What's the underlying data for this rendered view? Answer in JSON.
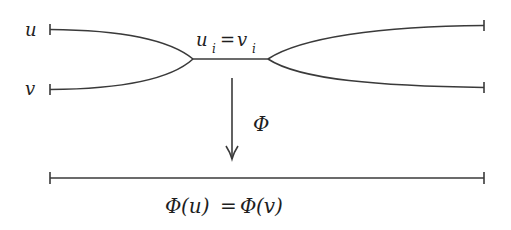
{
  "diagram": {
    "type": "path-merge-projection",
    "labels": {
      "path_u": "u",
      "path_v": "v",
      "merge_lhs": "u",
      "merge_lhs_sub": "i",
      "merge_eq": "=",
      "merge_rhs": "v",
      "merge_rhs_sub": "i",
      "map": "Φ",
      "result_map1": "Φ",
      "result_arg1": "(u)",
      "result_eq": "=",
      "result_map2": "Φ",
      "result_arg2": "(v)"
    },
    "colors": {
      "stroke": "#3a3a3a",
      "text": "#1e1e1e",
      "background": "#ffffff"
    }
  }
}
